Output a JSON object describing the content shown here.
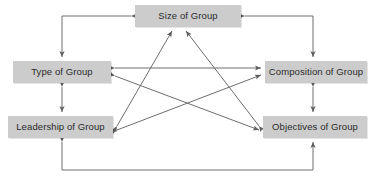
{
  "diagram": {
    "type": "node-link-diagram",
    "background_color": "#ffffff",
    "node_fill_color": "#cccccc",
    "node_text_color": "#2b2b2b",
    "edge_color": "#6e6e6e",
    "nodes": [
      {
        "id": "size",
        "label": "Size of Group"
      },
      {
        "id": "type",
        "label": "Type of Group"
      },
      {
        "id": "composition",
        "label": "Composition of Group"
      },
      {
        "id": "leadership",
        "label": "Leadership of Group"
      },
      {
        "id": "objectives",
        "label": "Objectives of Group"
      }
    ],
    "edges": [
      {
        "from": "size",
        "to": "type",
        "arrows": "both",
        "routing": "orthogonal-top-left"
      },
      {
        "from": "size",
        "to": "composition",
        "arrows": "both",
        "routing": "orthogonal-top-right"
      },
      {
        "from": "type",
        "to": "composition",
        "arrows": "both",
        "routing": "horizontal"
      },
      {
        "from": "type",
        "to": "leadership",
        "arrows": "both",
        "routing": "vertical"
      },
      {
        "from": "composition",
        "to": "objectives",
        "arrows": "both",
        "routing": "vertical"
      },
      {
        "from": "leadership",
        "to": "objectives",
        "arrows": "both",
        "routing": "orthogonal-bottom"
      },
      {
        "from": "leadership",
        "to": "size",
        "arrows": "both",
        "routing": "diagonal"
      },
      {
        "from": "objectives",
        "to": "size",
        "arrows": "both",
        "routing": "diagonal"
      },
      {
        "from": "leadership",
        "to": "composition",
        "arrows": "both",
        "routing": "diagonal"
      },
      {
        "from": "type",
        "to": "objectives",
        "arrows": "both",
        "routing": "diagonal"
      }
    ]
  }
}
